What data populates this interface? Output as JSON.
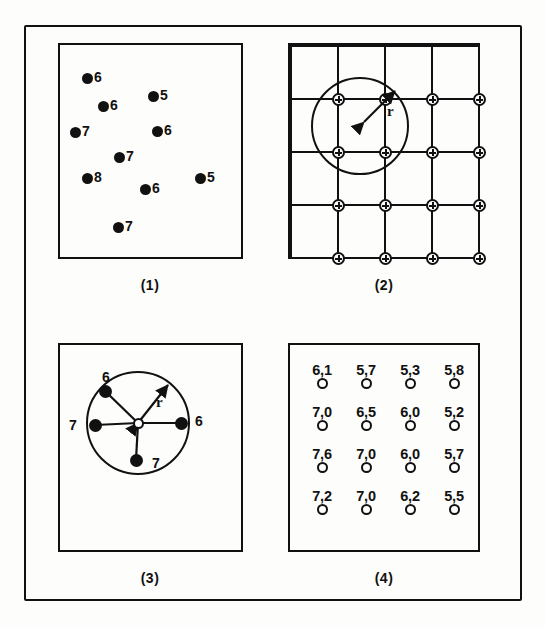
{
  "figure": {
    "outer_frame": true,
    "ink_color": "#111111",
    "paper_color": "#fdfdfb"
  },
  "panels": [
    {
      "id": "panel-1",
      "caption": "(1)",
      "kind": "scatter-sample-points",
      "points": [
        {
          "label": "6",
          "x": 22,
          "y": 28
        },
        {
          "label": "5",
          "x": 88,
          "y": 46
        },
        {
          "label": "6",
          "x": 38,
          "y": 56
        },
        {
          "label": "7",
          "x": 10,
          "y": 82
        },
        {
          "label": "6",
          "x": 92,
          "y": 81
        },
        {
          "label": "7",
          "x": 54,
          "y": 107
        },
        {
          "label": "8",
          "x": 22,
          "y": 128
        },
        {
          "label": "5",
          "x": 135,
          "y": 128
        },
        {
          "label": "6",
          "x": 80,
          "y": 139
        },
        {
          "label": "7",
          "x": 53,
          "y": 177
        }
      ]
    },
    {
      "id": "panel-2",
      "caption": "(2)",
      "kind": "regular-grid-with-search-radius",
      "grid": {
        "v_lines": 5,
        "h_lines": 5,
        "nodes_x": 4,
        "nodes_y": 4
      },
      "radius_label": "r",
      "search_circle": {
        "cx": 70,
        "cy": 81,
        "r": 49
      }
    },
    {
      "id": "panel-3",
      "caption": "(3)",
      "kind": "neighbour-star",
      "radius_label": "r",
      "center": {
        "cx": 78,
        "cy": 78
      },
      "circle_radius": 52,
      "neighbours": [
        {
          "label": "6",
          "nx": 45,
          "ny": 46,
          "label_x": 42,
          "label_y": 24
        },
        {
          "label": "7",
          "nx": 35,
          "ny": 80,
          "label_x": 9,
          "label_y": 72
        },
        {
          "label": "6",
          "nx": 121,
          "ny": 78,
          "label_x": 135,
          "label_y": 68
        },
        {
          "label": "7",
          "nx": 76,
          "ny": 115,
          "label_x": 92,
          "label_y": 110
        }
      ]
    },
    {
      "id": "panel-4",
      "caption": "(4)",
      "kind": "interpolated-grid-values",
      "columns": 4,
      "rows": 4,
      "values": [
        [
          "6,1",
          "5,7",
          "5,3",
          "5,8"
        ],
        [
          "7,0",
          "6,5",
          "6,0",
          "5,2"
        ],
        [
          "7,6",
          "7,0",
          "6,0",
          "5,7"
        ],
        [
          "7,2",
          "7,0",
          "6,2",
          "5,5"
        ]
      ]
    }
  ]
}
